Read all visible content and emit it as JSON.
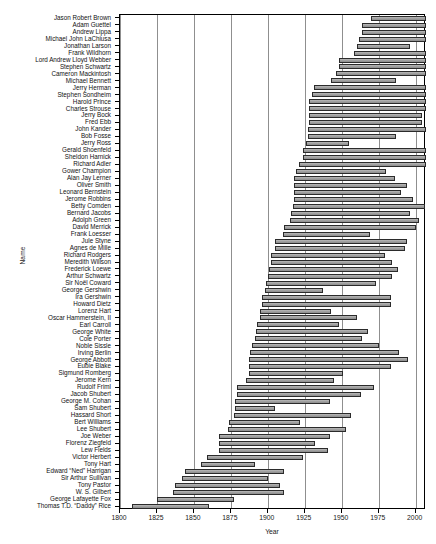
{
  "chart_data": {
    "type": "bar",
    "orientation": "horizontal",
    "subtype": "gantt-lifespan-range",
    "title": "",
    "xlabel": "Year",
    "ylabel": "Name",
    "xlim": [
      1800,
      2007
    ],
    "ylim": [
      0,
      67
    ],
    "xticks": [
      1800,
      1825,
      1850,
      1875,
      1900,
      1925,
      1950,
      1975,
      2000
    ],
    "xtick_labels": [
      "1800",
      "1825",
      "1850",
      "1875",
      "1900",
      "1925",
      "1950",
      "1975",
      "2000"
    ],
    "grid": "vertical-only",
    "legend": "none",
    "bar_fill": "#9b9b9b",
    "bar_edge": "#2b2b2b",
    "categories": [
      "Jason Robert Brown",
      "Adam Guettel",
      "Andrew Lippa",
      "Michael John LaChiusa",
      "Jonathan Larson",
      "Frank Wildhorn",
      "Lord Andrew Lloyd Webber",
      "Stephen Schwartz",
      "Cameron Mackintosh",
      "Michael Bennett",
      "Jerry Herman",
      "Stephen Sondheim",
      "Harold Prince",
      "Charles Strouse",
      "Jerry Bock",
      "Fred Ebb",
      "John Kander",
      "Bob Fosse",
      "Jerry Ross",
      "Gerald Shoenfeld",
      "Sheldon Harnick",
      "Richard Adler",
      "Gower Champion",
      "Alan Jay Lerner",
      "Oliver Smith",
      "Leonard Bernstein",
      "Jerome Robbins",
      "Betty Comden",
      "Bernard Jacobs",
      "Adolph Green",
      "David Merrick",
      "Frank Loesser",
      "Jule Styne",
      "Agnes de Mille",
      "Richard Rodgers",
      "Meredith Willson",
      "Frederick Loewe",
      "Arthur Schwartz",
      "Sir Noël Coward",
      "George Gershwin",
      "Ira Gershwin",
      "Howard Dietz",
      "Lorenz Hart",
      "Oscar Hammerstein, II",
      "Earl Carroll",
      "George White",
      "Cole Porter",
      "Noble Sissle",
      "Irving Berlin",
      "George Abbott",
      "Eubie Blake",
      "Sigmund Romberg",
      "Jerome Kern",
      "Rudolf Friml",
      "Jacob Shubert",
      "George M. Cohan",
      "Sam Shubert",
      "Hassard Short",
      "Bert Williams",
      "Lee Shubert",
      "Joe Weber",
      "Florenz Ziegfeld",
      "Lew Fields",
      "Victor Herbert",
      "Tony Hart",
      "Edward “Ned” Harrigan",
      "Sir Arthur Sullivan",
      "Tony Pastor",
      "W. S. Gilbert",
      "George Lafayette Fox",
      "Thomas T.D. “Daddy” Rice"
    ],
    "spans": [
      {
        "name": "Jason Robert Brown",
        "start": 1970,
        "end": 2007
      },
      {
        "name": "Adam Guettel",
        "start": 1964,
        "end": 2007
      },
      {
        "name": "Andrew Lippa",
        "start": 1964,
        "end": 2007
      },
      {
        "name": "Michael John LaChiusa",
        "start": 1962,
        "end": 2007
      },
      {
        "name": "Jonathan Larson",
        "start": 1960,
        "end": 1996
      },
      {
        "name": "Frank Wildhorn",
        "start": 1958,
        "end": 2007
      },
      {
        "name": "Lord Andrew Lloyd Webber",
        "start": 1948,
        "end": 2007
      },
      {
        "name": "Stephen Schwartz",
        "start": 1948,
        "end": 2007
      },
      {
        "name": "Cameron Mackintosh",
        "start": 1946,
        "end": 2007
      },
      {
        "name": "Michael Bennett",
        "start": 1943,
        "end": 1987
      },
      {
        "name": "Jerry Herman",
        "start": 1931,
        "end": 2007
      },
      {
        "name": "Stephen Sondheim",
        "start": 1930,
        "end": 2007
      },
      {
        "name": "Harold Prince",
        "start": 1928,
        "end": 2007
      },
      {
        "name": "Charles Strouse",
        "start": 1928,
        "end": 2007
      },
      {
        "name": "Jerry Bock",
        "start": 1928,
        "end": 2004
      },
      {
        "name": "Fred Ebb",
        "start": 1928,
        "end": 2004
      },
      {
        "name": "John Kander",
        "start": 1927,
        "end": 2007
      },
      {
        "name": "Bob Fosse",
        "start": 1927,
        "end": 1987
      },
      {
        "name": "Jerry Ross",
        "start": 1926,
        "end": 1955
      },
      {
        "name": "Gerald Shoenfeld",
        "start": 1924,
        "end": 2007
      },
      {
        "name": "Sheldon Harnick",
        "start": 1924,
        "end": 2007
      },
      {
        "name": "Richard Adler",
        "start": 1921,
        "end": 2007
      },
      {
        "name": "Gower Champion",
        "start": 1919,
        "end": 1980
      },
      {
        "name": "Alan Jay Lerner",
        "start": 1918,
        "end": 1986
      },
      {
        "name": "Oliver Smith",
        "start": 1918,
        "end": 1994
      },
      {
        "name": "Leonard Bernstein",
        "start": 1918,
        "end": 1990
      },
      {
        "name": "Jerome Robbins",
        "start": 1918,
        "end": 1998
      },
      {
        "name": "Betty Comden",
        "start": 1917,
        "end": 2006
      },
      {
        "name": "Bernard Jacobs",
        "start": 1916,
        "end": 1996
      },
      {
        "name": "Adolph Green",
        "start": 1915,
        "end": 2002
      },
      {
        "name": "David Merrick",
        "start": 1911,
        "end": 2000
      },
      {
        "name": "Frank Loesser",
        "start": 1910,
        "end": 1969
      },
      {
        "name": "Jule Styne",
        "start": 1905,
        "end": 1994
      },
      {
        "name": "Agnes de Mille",
        "start": 1905,
        "end": 1993
      },
      {
        "name": "Richard Rodgers",
        "start": 1902,
        "end": 1979
      },
      {
        "name": "Meredith Willson",
        "start": 1902,
        "end": 1984
      },
      {
        "name": "Frederick Loewe",
        "start": 1901,
        "end": 1988
      },
      {
        "name": "Arthur Schwartz",
        "start": 1900,
        "end": 1984
      },
      {
        "name": "Sir Noël Coward",
        "start": 1899,
        "end": 1973
      },
      {
        "name": "George Gershwin",
        "start": 1898,
        "end": 1937
      },
      {
        "name": "Ira Gershwin",
        "start": 1896,
        "end": 1983
      },
      {
        "name": "Howard Dietz",
        "start": 1896,
        "end": 1983
      },
      {
        "name": "Lorenz Hart",
        "start": 1895,
        "end": 1943
      },
      {
        "name": "Oscar Hammerstein, II",
        "start": 1895,
        "end": 1960
      },
      {
        "name": "Earl Carroll",
        "start": 1893,
        "end": 1948
      },
      {
        "name": "George White",
        "start": 1892,
        "end": 1968
      },
      {
        "name": "Cole Porter",
        "start": 1891,
        "end": 1964
      },
      {
        "name": "Noble Sissle",
        "start": 1889,
        "end": 1975
      },
      {
        "name": "Irving Berlin",
        "start": 1888,
        "end": 1989
      },
      {
        "name": "George Abbott",
        "start": 1887,
        "end": 1995
      },
      {
        "name": "Eubie Blake",
        "start": 1887,
        "end": 1983
      },
      {
        "name": "Sigmund Romberg",
        "start": 1887,
        "end": 1951
      },
      {
        "name": "Jerome Kern",
        "start": 1885,
        "end": 1945
      },
      {
        "name": "Rudolf Friml",
        "start": 1879,
        "end": 1972
      },
      {
        "name": "Jacob Shubert",
        "start": 1879,
        "end": 1963
      },
      {
        "name": "George M. Cohan",
        "start": 1878,
        "end": 1942
      },
      {
        "name": "Sam Shubert",
        "start": 1878,
        "end": 1905
      },
      {
        "name": "Hassard Short",
        "start": 1877,
        "end": 1956
      },
      {
        "name": "Bert Williams",
        "start": 1874,
        "end": 1922
      },
      {
        "name": "Lee Shubert",
        "start": 1873,
        "end": 1953
      },
      {
        "name": "Joe Weber",
        "start": 1867,
        "end": 1942
      },
      {
        "name": "Florenz Ziegfeld",
        "start": 1867,
        "end": 1932
      },
      {
        "name": "Lew Fields",
        "start": 1867,
        "end": 1941
      },
      {
        "name": "Victor Herbert",
        "start": 1859,
        "end": 1924
      },
      {
        "name": "Tony Hart",
        "start": 1855,
        "end": 1891
      },
      {
        "name": "Edward “Ned” Harrigan",
        "start": 1844,
        "end": 1911
      },
      {
        "name": "Sir Arthur Sullivan",
        "start": 1842,
        "end": 1900
      },
      {
        "name": "Tony Pastor",
        "start": 1837,
        "end": 1908
      },
      {
        "name": "W. S. Gilbert",
        "start": 1836,
        "end": 1911
      },
      {
        "name": "George Lafayette Fox",
        "start": 1825,
        "end": 1877
      },
      {
        "name": "Thomas T.D. “Daddy” Rice",
        "start": 1808,
        "end": 1860
      }
    ]
  }
}
